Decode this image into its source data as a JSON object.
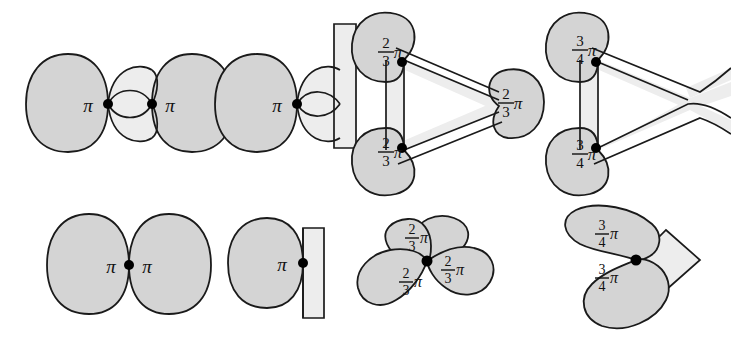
{
  "figure": {
    "canvas": {
      "width": 731,
      "height": 342,
      "background": "#ffffff"
    },
    "style": {
      "bubble_fill": "#d4d4d4",
      "band_fill": "#eeeeee",
      "outline": "#1a1a1a",
      "outline_width": 1.8,
      "vertex_color": "#000000",
      "label_color": "#111111"
    },
    "rows": [
      {
        "name": "upper-row",
        "description": "Junction models with connecting films / bands"
      },
      {
        "name": "lower-row",
        "description": "Tangent-cone models at the junction point"
      }
    ],
    "panels": [
      {
        "id": "panel-1",
        "name": "two-bubbles-with-film",
        "row": "upper-row",
        "vertex_count": 2,
        "wall": false,
        "labels": [
          {
            "text": "pi",
            "display": "π",
            "kind": "plain",
            "x": 88,
            "y": 105
          },
          {
            "text": "pi",
            "display": "π",
            "kind": "plain",
            "x": 162,
            "y": 105
          }
        ],
        "angle_values": [
          "π",
          "π"
        ]
      },
      {
        "id": "panel-2",
        "name": "bubble-with-film-on-wall",
        "row": "upper-row",
        "vertex_count": 1,
        "wall": true,
        "labels": [
          {
            "text": "pi",
            "display": "π",
            "kind": "plain",
            "x": 277,
            "y": 105
          }
        ],
        "angle_values": [
          "π"
        ]
      },
      {
        "id": "panel-3",
        "name": "triple-junction-triangle",
        "row": "upper-row",
        "vertex_count": 2,
        "wall": false,
        "labels": [
          {
            "numerator": "2",
            "denominator": "3",
            "kind": "fraction",
            "display": "2/3 π",
            "x": 410,
            "y": 60
          },
          {
            "numerator": "2",
            "denominator": "3",
            "kind": "fraction",
            "display": "2/3 π",
            "x": 410,
            "y": 155
          },
          {
            "numerator": "2",
            "denominator": "3",
            "kind": "fraction",
            "display": "2/3 π",
            "x": 500,
            "y": 107
          }
        ],
        "angle_values": [
          "⅔π",
          "⅔π",
          "⅔π"
        ]
      },
      {
        "id": "panel-4",
        "name": "tetrahedral-junction-bands",
        "row": "upper-row",
        "vertex_count": 2,
        "wall": false,
        "labels": [
          {
            "numerator": "3",
            "denominator": "4",
            "kind": "fraction",
            "display": "3/4 π",
            "x": 602,
            "y": 58
          },
          {
            "numerator": "3",
            "denominator": "4",
            "kind": "fraction",
            "display": "3/4 π",
            "x": 602,
            "y": 152
          }
        ],
        "angle_values": [
          "¾π",
          "¾π"
        ]
      },
      {
        "id": "panel-5",
        "name": "two-lobe-tangent-cone",
        "row": "lower-row",
        "vertex_count": 1,
        "wall": false,
        "labels": [
          {
            "text": "pi",
            "display": "π",
            "kind": "plain",
            "x": 113,
            "y": 272
          },
          {
            "text": "pi",
            "display": "π",
            "kind": "plain",
            "x": 145,
            "y": 272
          }
        ],
        "angle_values": [
          "π",
          "π"
        ]
      },
      {
        "id": "panel-6",
        "name": "single-lobe-on-wall-tangent-cone",
        "row": "lower-row",
        "vertex_count": 1,
        "wall": true,
        "labels": [
          {
            "text": "pi",
            "display": "π",
            "kind": "plain",
            "x": 283,
            "y": 263
          }
        ],
        "angle_values": [
          "π"
        ]
      },
      {
        "id": "panel-7",
        "name": "three-lobe-tangent-cone",
        "row": "lower-row",
        "vertex_count": 1,
        "wall": false,
        "labels": [
          {
            "numerator": "2",
            "denominator": "3",
            "kind": "fraction",
            "display": "2/3 π",
            "x": 419,
            "y": 240
          },
          {
            "numerator": "2",
            "denominator": "3",
            "kind": "fraction",
            "display": "2/3 π",
            "x": 446,
            "y": 282
          },
          {
            "numerator": "2",
            "denominator": "3",
            "kind": "fraction",
            "display": "2/3 π",
            "x": 420,
            "y": 279
          }
        ],
        "angle_values": [
          "⅔π",
          "⅔π",
          "⅔π"
        ]
      },
      {
        "id": "panel-8",
        "name": "two-lobe-with-wedge-tangent-cone",
        "row": "lower-row",
        "vertex_count": 1,
        "wall": false,
        "labels": [
          {
            "numerator": "3",
            "denominator": "4",
            "kind": "fraction",
            "display": "3/4 π",
            "x": 608,
            "y": 237
          },
          {
            "numerator": "3",
            "denominator": "4",
            "kind": "fraction",
            "display": "3/4 π",
            "x": 608,
            "y": 280
          }
        ],
        "angle_values": [
          "¾π",
          "¾π"
        ]
      }
    ],
    "glyphs": {
      "pi": "π",
      "vertex": "filled-dot"
    }
  }
}
